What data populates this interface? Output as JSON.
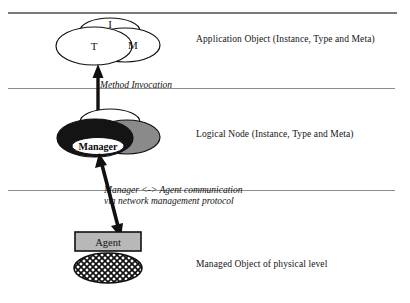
{
  "diagram": {
    "title_text": null,
    "layers": [
      {
        "id": "application",
        "side_label": "Application Object (Instance, Type and Meta)",
        "nodes": [
          {
            "id": "instance",
            "label": "I",
            "fill": "white"
          },
          {
            "id": "type",
            "label": "T",
            "fill": "white"
          },
          {
            "id": "meta",
            "label": "M",
            "fill": "white"
          }
        ]
      },
      {
        "id": "logical-node",
        "side_label": "Logical Node (Instance, Type and Meta)",
        "nodes": [
          {
            "id": "instance",
            "label": "",
            "fill": "white"
          },
          {
            "id": "type",
            "label": "",
            "fill": "black"
          },
          {
            "id": "meta",
            "label": "",
            "fill": "gray"
          }
        ],
        "inner_label": "Manager"
      },
      {
        "id": "physical",
        "side_label": "Managed Object of physical level",
        "box_label": "Agent",
        "shape_label": ""
      }
    ],
    "connectors": [
      {
        "id": "method-invocation",
        "text": "Method Invocation",
        "style": "double-headed-vertical-arrow"
      },
      {
        "id": "manager-agent",
        "text_line1": "Manager <-> Agent communication",
        "text_line2": "via network management protocol",
        "style": "double-headed-slanted-arrow"
      }
    ]
  },
  "colors": {
    "rule": "#8d8d8d",
    "rule_top": "#7a7a7a",
    "stroke": "#111111",
    "fill_black": "#141414",
    "fill_gray": "#8a8a8a",
    "fill_white": "#ffffff",
    "box_fill": "#b8b8b8",
    "text": "#141414"
  }
}
